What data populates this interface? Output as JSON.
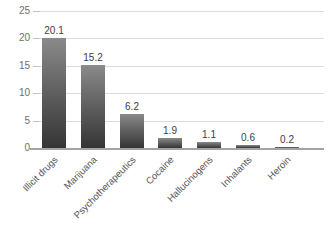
{
  "chart_data": {
    "type": "bar",
    "title": "",
    "xlabel": "",
    "ylabel": "",
    "categories": [
      "Illicit drugs",
      "Marijuana",
      "Psychotherapeutics",
      "Cocaine",
      "Hallucinogens",
      "Inhalants",
      "Heroin"
    ],
    "values": [
      20.1,
      15.2,
      6.2,
      1.9,
      1.1,
      0.6,
      0.2
    ],
    "data_labels": [
      "20.1",
      "15.2",
      "6.2",
      "1.9",
      "1.1",
      "0.6",
      "0.2"
    ],
    "yticks": [
      "0",
      "5",
      "10",
      "15",
      "20",
      "25"
    ],
    "ytick_values": [
      0,
      5,
      10,
      15,
      20,
      25
    ],
    "ylim": [
      0,
      25
    ],
    "grid": true,
    "legend": false,
    "x_label_rotation_deg": 45,
    "colors": {
      "background": "#ffffff",
      "bar_gradient_top": "#8a8a8a",
      "bar_gradient_mid": "#636363",
      "bar_gradient_bottom": "#353535",
      "gridline": "#dcdcdc",
      "tick_mark": "#c2c2c2",
      "axis_line": "#a3a3a3",
      "y_tick_label": "#6e6e6e",
      "data_label": "#3d3d3d",
      "x_category_label": "#555555"
    }
  }
}
